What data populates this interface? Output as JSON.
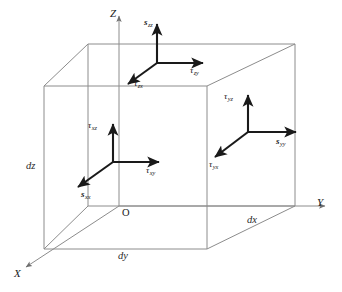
{
  "figure": {
    "type": "stress-element-cube",
    "projection": "oblique",
    "origin_label": "O",
    "colors": {
      "cube_edge": "#8c8c8c",
      "vector": "#1a1a1a",
      "axis": "#8c8c8c",
      "background": "#ffffff",
      "text": "#1a1a1a"
    }
  },
  "axes": [
    {
      "name": "x-axis",
      "label": "X",
      "direction": "down-left"
    },
    {
      "name": "y-axis",
      "label": "Y",
      "direction": "right"
    },
    {
      "name": "z-axis",
      "label": "Z",
      "direction": "up"
    }
  ],
  "dimensions": [
    {
      "name": "dz",
      "label": "dz",
      "edge": "left-vertical"
    },
    {
      "name": "dy",
      "label": "dy",
      "edge": "bottom-front-horizontal"
    },
    {
      "name": "dx",
      "label": "dx",
      "edge": "bottom-right-receding"
    }
  ],
  "stress_groups": [
    {
      "face": "top-face",
      "components": [
        {
          "name": "sigma-zz",
          "glyph": "s",
          "sub": "zz",
          "kind": "normal",
          "direction": "up"
        },
        {
          "name": "tau-zy",
          "glyph": "τ",
          "sub": "zy",
          "kind": "shear",
          "direction": "right"
        },
        {
          "name": "tau-zx",
          "glyph": "τ",
          "sub": "zx",
          "kind": "shear",
          "direction": "down-left"
        }
      ]
    },
    {
      "face": "front-face",
      "components": [
        {
          "name": "tau-xz",
          "glyph": "τ",
          "sub": "xz",
          "kind": "shear",
          "direction": "up"
        },
        {
          "name": "tau-xy",
          "glyph": "τ",
          "sub": "xy",
          "kind": "shear",
          "direction": "right"
        },
        {
          "name": "sigma-xx",
          "glyph": "s",
          "sub": "xx",
          "kind": "normal",
          "direction": "down-left"
        }
      ]
    },
    {
      "face": "right-face",
      "components": [
        {
          "name": "tau-yz",
          "glyph": "τ",
          "sub": "yz",
          "kind": "shear",
          "direction": "up"
        },
        {
          "name": "sigma-yy",
          "glyph": "s",
          "sub": "yy",
          "kind": "normal",
          "direction": "right"
        },
        {
          "name": "tau-yx",
          "glyph": "τ",
          "sub": "yx",
          "kind": "shear",
          "direction": "down-left"
        }
      ]
    }
  ]
}
